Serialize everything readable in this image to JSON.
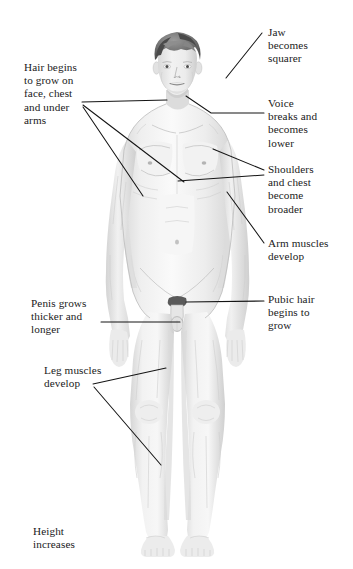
{
  "diagram": {
    "figure_name": "adolescent-male-body-diagram",
    "background_color": "#ffffff",
    "text_color": "#1a1a1a",
    "leader_line_color": "#141414"
  },
  "labels": [
    {
      "id": "jaw",
      "name": "label-jaw-becomes-squarer",
      "text": "Jaw\nbecomes\nsquarer",
      "x": 268,
      "y": 26,
      "align": "left"
    },
    {
      "id": "hair",
      "name": "label-hair-begins-to-grow",
      "text": "Hair begins\nto grow on\nface, chest\nand under\narms",
      "x": 24,
      "y": 61,
      "align": "left"
    },
    {
      "id": "voice",
      "name": "label-voice-breaks",
      "text": "Voice\nbreaks and\nbecomes\nlower",
      "x": 268,
      "y": 97,
      "align": "left"
    },
    {
      "id": "shoulders",
      "name": "label-shoulders-and-chest",
      "text": "Shoulders\nand chest\nbecome\nbroader",
      "x": 268,
      "y": 163,
      "align": "left"
    },
    {
      "id": "arm",
      "name": "label-arm-muscles-develop",
      "text": "Arm muscles\ndevelop",
      "x": 268,
      "y": 237,
      "align": "left"
    },
    {
      "id": "penis",
      "name": "label-penis-grows",
      "text": "Penis grows\nthicker and\nlonger",
      "x": 31,
      "y": 297,
      "align": "left"
    },
    {
      "id": "pubic",
      "name": "label-pubic-hair",
      "text": "Pubic hair\nbegins to\ngrow",
      "x": 268,
      "y": 293,
      "align": "left"
    },
    {
      "id": "leg",
      "name": "label-leg-muscles-develop",
      "text": "Leg muscles\ndevelop",
      "x": 44,
      "y": 364,
      "align": "left"
    },
    {
      "id": "height",
      "name": "label-height-increases",
      "text": "Height\nincreases",
      "x": 33,
      "y": 525,
      "align": "left"
    }
  ],
  "leaders": [
    {
      "name": "leader-jaw",
      "points": "262,33 226,78"
    },
    {
      "name": "leader-voice-trunk",
      "points": "264,113 210,113"
    },
    {
      "name": "leader-voice-tail",
      "points": "210,113 186,96"
    },
    {
      "name": "leader-hair-node",
      "points": "82,103"
    },
    {
      "name": "leader-hair-face",
      "points": "82,102 167,100"
    },
    {
      "name": "leader-hair-chest",
      "points": "83,105 184,182"
    },
    {
      "name": "leader-hair-arm",
      "points": "83,107 143,196"
    },
    {
      "name": "leader-shoulder-node",
      "points": "264,172"
    },
    {
      "name": "leader-shoulder-up",
      "points": "264,170 213,149"
    },
    {
      "name": "leader-shoulder-dn",
      "points": "264,175 178,181"
    },
    {
      "name": "leader-arm",
      "points": "264,243 227,192"
    },
    {
      "name": "leader-pubic",
      "points": "264,301 186,302"
    },
    {
      "name": "leader-penis",
      "points": "101,322 180,322"
    },
    {
      "name": "leader-leg-node",
      "points": "93,385"
    },
    {
      "name": "leader-leg-up",
      "points": "93,384 166,368"
    },
    {
      "name": "leader-leg-dn",
      "points": "94,387 161,465"
    }
  ]
}
